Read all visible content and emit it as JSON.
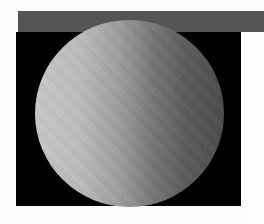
{
  "image": {
    "subject": "shaded sphere render",
    "colors": {
      "top_bar": "#555555",
      "background_box": "#000000",
      "page_background": "#fbfbfb",
      "sphere_light": "#c9c9c9",
      "sphere_dark": "#4a4a4a"
    }
  }
}
